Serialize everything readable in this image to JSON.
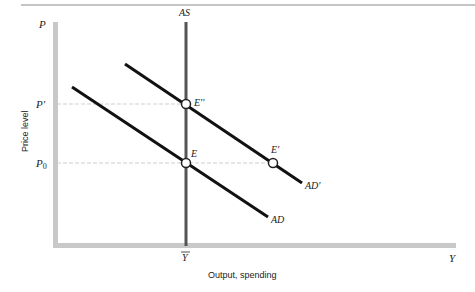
{
  "diagram": {
    "type": "economics-ad-as",
    "axes": {
      "y_symbol": "P",
      "x_symbol": "Y",
      "y_label": "Price level",
      "x_label": "Output, spending",
      "y_ticks": [
        "P'",
        "P0"
      ],
      "x_ticks": [
        "Ȳ"
      ]
    },
    "curves": {
      "as_label": "AS",
      "ad_label": "AD",
      "ad_prime_label": "AD'"
    },
    "points": {
      "e_label": "E",
      "e_prime_label": "E'",
      "e_double_prime_label": "E''"
    },
    "ticks": {
      "p_prime": "P'",
      "p0_main": "P",
      "p0_sub": "0",
      "ybar": "Y"
    },
    "colors": {
      "axis": "#c8c8c8",
      "curve": "#111111",
      "as_line": "#555555",
      "guide": "#cfcfcf",
      "rule": "#888888"
    }
  }
}
